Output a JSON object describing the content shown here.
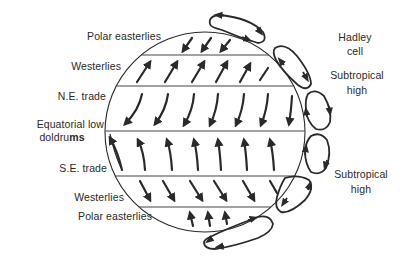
{
  "diagram": {
    "title": "",
    "type": "global atmospheric circulation",
    "stroke_color": "#2a2a2a",
    "background": "#ffffff"
  },
  "left_labels": {
    "polar_easterlies_north": "Polar easterlies",
    "westerlies_north": "Westerlies",
    "ne_trade": "N.E. trade",
    "equatorial_low_line1": "Equatorial low",
    "equatorial_low_line2_a": "doldru",
    "equatorial_low_line2_b": "ms",
    "se_trade": "S.E. trade",
    "westerlies_south": "Westerlies",
    "polar_easterlies_south": "Polar easterlies"
  },
  "right_labels": {
    "hadley_line1": "Hadley",
    "hadley_line2": "cell",
    "subtropical_high_north_line1": "Subtropical",
    "subtropical_high_north_line2": "high",
    "subtropical_high_south_line1": "Subtropical",
    "subtropical_high_south_line2": "high"
  },
  "bands": [
    {
      "name": "Polar easterlies (N)",
      "wind_direction": "from NE"
    },
    {
      "name": "Westerlies (N)",
      "wind_direction": "from SW"
    },
    {
      "name": "N.E. trade",
      "wind_direction": "from NE"
    },
    {
      "name": "Equatorial low / doldrums",
      "wind_direction": "convergence"
    },
    {
      "name": "S.E. trade",
      "wind_direction": "from SE"
    },
    {
      "name": "Westerlies (S)",
      "wind_direction": "from NW"
    },
    {
      "name": "Polar easterlies (S)",
      "wind_direction": "from SE"
    }
  ],
  "cells": [
    {
      "name": "Polar cell (N)"
    },
    {
      "name": "Ferrel cell (N)"
    },
    {
      "name": "Hadley cell (N)"
    },
    {
      "name": "Hadley cell (S)"
    },
    {
      "name": "Ferrel cell (S)"
    },
    {
      "name": "Polar cell (S)"
    }
  ]
}
